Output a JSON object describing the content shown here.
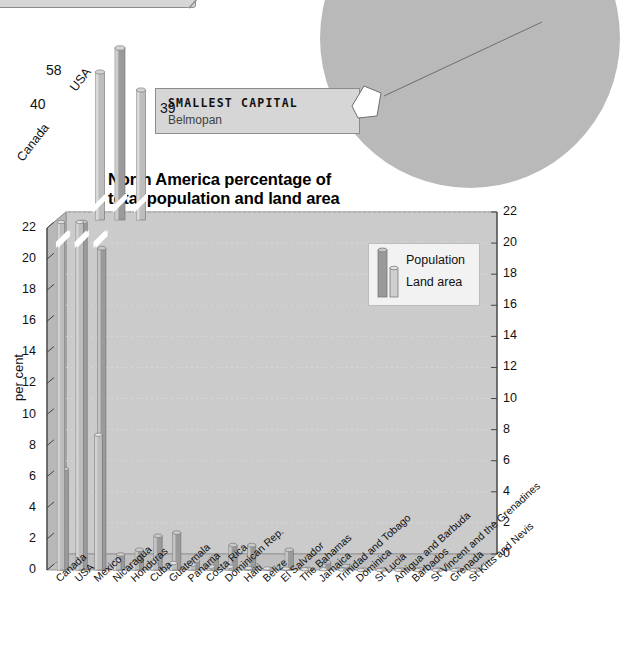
{
  "callouts": {
    "mexico_city": {
      "label": "Mexico City"
    },
    "smallest_capital": {
      "title": "SMALLEST CAPITAL",
      "value": "Belmopan"
    }
  },
  "chart_data": {
    "type": "bar",
    "title": "North America percentage of total population and land area",
    "title_line1": "North America percentage of",
    "title_line2": "total population and land area",
    "xlabel": "",
    "ylabel": "per cent",
    "ylim": [
      0,
      22
    ],
    "yticks": [
      0,
      2,
      4,
      6,
      8,
      10,
      12,
      14,
      16,
      18,
      20,
      22
    ],
    "grid": true,
    "axis_break": true,
    "axis_break_note": "Bars for Canada, USA and Mexico exceed the 22 per cent scale and are drawn above an axis break with their values labelled",
    "legend": {
      "position": "top-right-inside",
      "entries": [
        "Population",
        "Land area"
      ]
    },
    "categories": [
      "Canada",
      "USA",
      "Mexico",
      "Nicaragua",
      "Honduras",
      "Cuba",
      "Guatemala",
      "Panama",
      "Costa Rica",
      "Dominican Rep.",
      "Haiti",
      "Belize",
      "El Salvador",
      "The Bahamas",
      "Jamaica",
      "Trinidad and Tobago",
      "Dominica",
      "St Lucia",
      "Antigua and Barbuda",
      "Barbados",
      "St Vincent and the Grenadines",
      "Grenada",
      "St Kitts and Nevis"
    ],
    "series": [
      {
        "name": "Population",
        "color": "#9a9a9a",
        "values": [
          6.5,
          58.0,
          20.7,
          1.0,
          1.3,
          2.2,
          2.4,
          0.6,
          0.8,
          1.6,
          1.6,
          0.05,
          1.3,
          0.06,
          0.5,
          0.25,
          0.015,
          0.03,
          0.015,
          0.055,
          0.022,
          0.02,
          0.01
        ]
      },
      {
        "name": "Land area",
        "color": "#bdbdbd",
        "values": [
          40.0,
          39.0,
          8.7,
          0.6,
          0.5,
          0.5,
          0.45,
          0.35,
          0.22,
          0.21,
          0.12,
          0.1,
          0.09,
          0.05,
          0.045,
          0.024,
          0.003,
          0.003,
          0.002,
          0.002,
          0.002,
          0.0015,
          0.001
        ]
      }
    ],
    "value_labels_above_break": [
      {
        "category": "Canada",
        "series": "Land area",
        "value": 40
      },
      {
        "category": "USA",
        "series": "Population",
        "value": 58
      },
      {
        "category": "USA",
        "series": "Land area",
        "value": 39
      }
    ],
    "top_panel_labels": [
      "58",
      "40",
      "39"
    ],
    "top_panel_categories": [
      "Canada",
      "USA"
    ]
  }
}
